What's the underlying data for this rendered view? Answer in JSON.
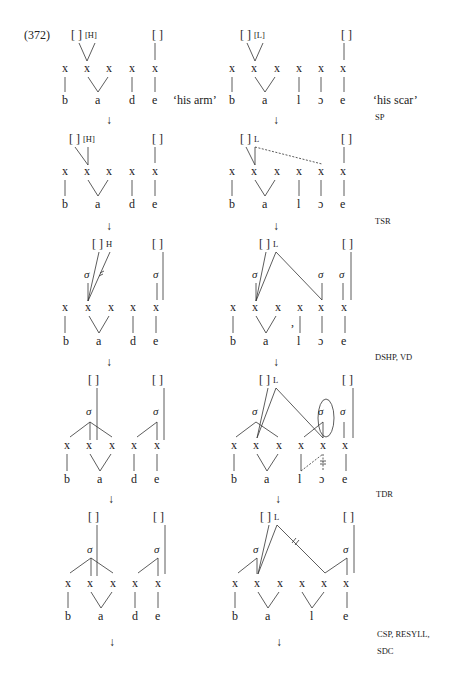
{
  "example": {
    "number": "(372)",
    "gloss_left": "‘his arm’",
    "gloss_right": "‘his scar’"
  },
  "rules": [
    {
      "label": "SP"
    },
    {
      "label": "TSR"
    },
    {
      "label": "DSHP, VD"
    },
    {
      "label": "TDR"
    },
    {
      "label": "CSP, RESYLL,"
    },
    {
      "label": "SDC"
    }
  ],
  "symbols": {
    "tone_box": "[ ]",
    "tone_H": "[H]",
    "tone_L": "[L]",
    "H": "H",
    "L": "L",
    "skeleton": "x",
    "sigma": "σ",
    "arrow": "↓",
    "bracket_open": "[",
    "bracket_close": "]"
  },
  "left_word": {
    "segments": [
      "b",
      "a",
      "d",
      "e"
    ]
  },
  "right_word": {
    "segments_initial": [
      "b",
      "a",
      "l",
      "ɔ",
      "e"
    ],
    "segments_final": [
      "b",
      "a",
      "l",
      "e"
    ]
  }
}
